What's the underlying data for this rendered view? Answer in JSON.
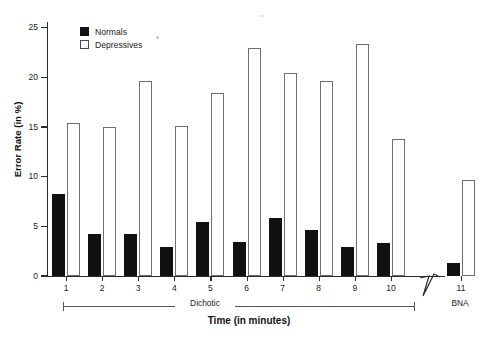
{
  "chart_data": {
    "type": "bar",
    "title": "",
    "xlabel": "Time (in minutes)",
    "ylabel": "Error Rate (in %)",
    "categories": [
      "1",
      "2",
      "3",
      "4",
      "5",
      "6",
      "7",
      "8",
      "9",
      "10",
      "11"
    ],
    "ylim": [
      0,
      26
    ],
    "yticks": [
      0,
      5,
      10,
      15,
      20,
      25
    ],
    "ytick_labels": [
      "0",
      "5",
      "10",
      "15",
      "20",
      "25"
    ],
    "grid": false,
    "legend_position": "top-left",
    "series": [
      {
        "name": "Normals",
        "style": "filled-black",
        "color": "#111111",
        "values": [
          8.3,
          4.2,
          4.2,
          2.9,
          5.4,
          3.4,
          5.8,
          4.6,
          2.9,
          3.3,
          1.3
        ]
      },
      {
        "name": "Depressives",
        "style": "hollow-white",
        "color": "#ffffff",
        "edge_color": "#6e6e6e",
        "values": [
          15.4,
          15.0,
          19.6,
          15.1,
          18.4,
          23.0,
          20.4,
          19.6,
          23.4,
          13.8,
          9.7
        ]
      }
    ],
    "annotations": [
      {
        "name": "condition-dichotic",
        "label": "Dichotic",
        "covers": [
          "1",
          "2",
          "3",
          "4",
          "5",
          "6",
          "7",
          "8",
          "9",
          "10"
        ]
      },
      {
        "name": "condition-bna",
        "label": "BNA",
        "covers": [
          "11"
        ]
      },
      {
        "name": "x-axis-break",
        "label": "axis break between 10 and 11"
      }
    ]
  },
  "legend": {
    "items": [
      {
        "label": "Normals",
        "swatch": "filled-square-icon"
      },
      {
        "label": "Depressives",
        "swatch": "hollow-square-icon"
      }
    ]
  },
  "axes": {
    "y_title": "Error Rate (in %)",
    "x_title": "Time (in minutes)"
  }
}
